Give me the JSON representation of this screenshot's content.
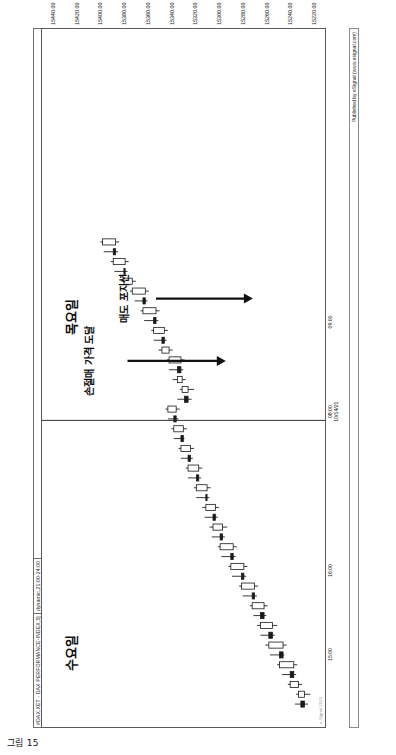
{
  "page": {
    "caption": "그림 15",
    "background": "#ffffff"
  },
  "header": {
    "symbol": "#DAX.XET - DAX PERFORMANCE-INDEX,5]",
    "session": "dynamic,21:00-24:00",
    "divider_color": "#6e6e6e"
  },
  "publisher": {
    "text": "Published by eSignal (www.esignal.com)"
  },
  "day_labels": [
    {
      "label": "수요일",
      "x_frac": 0.08
    },
    {
      "label": "목요일",
      "x_frac": 0.56
    }
  ],
  "annotations": [
    {
      "name": "stop-loss-annotation",
      "text": "손절매 가격 도달",
      "text_x_frac": 0.523,
      "text_y_frac": 0.18,
      "arrow_x_frac": 0.523,
      "arrow_y1_frac": 0.3,
      "arrow_y2_frac": 0.645,
      "arrow_head": true
    },
    {
      "name": "sell-position-annotation",
      "text": "매도 포지션",
      "text_x_frac": 0.612,
      "text_y_frac": 0.3,
      "arrow_x_frac": 0.612,
      "arrow_y1_frac": 0.4,
      "arrow_y2_frac": 0.74,
      "arrow_head": true
    }
  ],
  "chart_data": {
    "type": "candlestick",
    "title": "#DAX.XET - DAX PERFORMANCE-INDEX,5]",
    "subtitle": "dynamic,21:00-24:00",
    "xlabel": "",
    "ylabel": "",
    "grid": false,
    "legend": "none",
    "ylim": [
      15210,
      15450
    ],
    "y_ticks": [
      "15440.00",
      "15420.00",
      "15400.00",
      "15380.00",
      "15360.00",
      "15340.00",
      "15320.00",
      "15300.00",
      "15280.00",
      "15260.00",
      "15240.00",
      "15220.00"
    ],
    "y_tick_values": [
      15440,
      15420,
      15400,
      15380,
      15360,
      15340,
      15320,
      15300,
      15280,
      15260,
      15240,
      15220
    ],
    "x_ticks": [
      {
        "label": "15:00",
        "sub": "",
        "x_frac": 0.105
      },
      {
        "label": "16:00",
        "sub": "",
        "x_frac": 0.225
      },
      {
        "label": "08:00",
        "sub": "10/14/21",
        "x_frac": 0.452
      },
      {
        "label": "09:00",
        "sub": "",
        "x_frac": 0.58
      }
    ],
    "session_break_x_frac": 0.438,
    "up_color": "#ffffff",
    "down_color": "#1a1a1a",
    "wick_color": "#222222",
    "candles": [
      {
        "t": "15:00",
        "o": 15232,
        "h": 15237,
        "l": 15226,
        "c": 15229,
        "dir": "down"
      },
      {
        "t": "15:05",
        "o": 15229,
        "h": 15236,
        "l": 15224,
        "c": 15234,
        "dir": "up"
      },
      {
        "t": "15:10",
        "o": 15234,
        "h": 15243,
        "l": 15231,
        "c": 15241,
        "dir": "up"
      },
      {
        "t": "15:15",
        "o": 15241,
        "h": 15248,
        "l": 15236,
        "c": 15238,
        "dir": "down"
      },
      {
        "t": "15:20",
        "o": 15238,
        "h": 15252,
        "l": 15235,
        "c": 15250,
        "dir": "up"
      },
      {
        "t": "15:25",
        "o": 15250,
        "h": 15258,
        "l": 15246,
        "c": 15247,
        "dir": "down"
      },
      {
        "t": "15:30",
        "o": 15247,
        "h": 15262,
        "l": 15244,
        "c": 15259,
        "dir": "up"
      },
      {
        "t": "15:35",
        "o": 15259,
        "h": 15266,
        "l": 15254,
        "c": 15256,
        "dir": "down"
      },
      {
        "t": "15:40",
        "o": 15256,
        "h": 15269,
        "l": 15252,
        "c": 15266,
        "dir": "up"
      },
      {
        "t": "15:45",
        "o": 15266,
        "h": 15272,
        "l": 15261,
        "c": 15263,
        "dir": "down"
      },
      {
        "t": "15:50",
        "o": 15263,
        "h": 15275,
        "l": 15260,
        "c": 15273,
        "dir": "up"
      },
      {
        "t": "15:55",
        "o": 15273,
        "h": 15281,
        "l": 15269,
        "c": 15271,
        "dir": "down"
      },
      {
        "t": "16:00",
        "o": 15271,
        "h": 15284,
        "l": 15268,
        "c": 15282,
        "dir": "up"
      },
      {
        "t": "16:05",
        "o": 15282,
        "h": 15290,
        "l": 15278,
        "c": 15280,
        "dir": "down"
      },
      {
        "t": "16:10",
        "o": 15280,
        "h": 15293,
        "l": 15277,
        "c": 15291,
        "dir": "up"
      },
      {
        "t": "16:15",
        "o": 15291,
        "h": 15299,
        "l": 15287,
        "c": 15289,
        "dir": "down"
      },
      {
        "t": "16:20",
        "o": 15289,
        "h": 15302,
        "l": 15286,
        "c": 15300,
        "dir": "up"
      },
      {
        "t": "16:25",
        "o": 15300,
        "h": 15307,
        "l": 15296,
        "c": 15298,
        "dir": "down"
      },
      {
        "t": "16:30",
        "o": 15298,
        "h": 15309,
        "l": 15294,
        "c": 15306,
        "dir": "up"
      },
      {
        "t": "16:35",
        "o": 15306,
        "h": 15313,
        "l": 15302,
        "c": 15304,
        "dir": "down"
      },
      {
        "t": "16:40",
        "o": 15304,
        "h": 15315,
        "l": 15301,
        "c": 15312,
        "dir": "up"
      },
      {
        "t": "16:45",
        "o": 15312,
        "h": 15320,
        "l": 15309,
        "c": 15311,
        "dir": "down"
      },
      {
        "t": "16:50",
        "o": 15311,
        "h": 15322,
        "l": 15308,
        "c": 15320,
        "dir": "up"
      },
      {
        "t": "16:55",
        "o": 15320,
        "h": 15327,
        "l": 15316,
        "c": 15318,
        "dir": "down"
      },
      {
        "t": "17:00",
        "o": 15318,
        "h": 15329,
        "l": 15315,
        "c": 15327,
        "dir": "up"
      },
      {
        "t": "17:05",
        "o": 15327,
        "h": 15333,
        "l": 15323,
        "c": 15325,
        "dir": "down"
      },
      {
        "t": "17:10",
        "o": 15325,
        "h": 15335,
        "l": 15322,
        "c": 15333,
        "dir": "up"
      },
      {
        "t": "17:15",
        "o": 15333,
        "h": 15339,
        "l": 15330,
        "c": 15331,
        "dir": "down"
      },
      {
        "t": "17:20",
        "o": 15331,
        "h": 15341,
        "l": 15328,
        "c": 15339,
        "dir": "up"
      },
      {
        "t": "17:25",
        "o": 15339,
        "h": 15344,
        "l": 15335,
        "c": 15337,
        "dir": "down"
      },
      {
        "t": "17:30",
        "o": 15337,
        "h": 15346,
        "l": 15334,
        "c": 15344,
        "dir": "up"
      },
      {
        "t": "08:00",
        "o": 15330,
        "h": 15336,
        "l": 15324,
        "c": 15327,
        "dir": "down"
      },
      {
        "t": "08:05",
        "o": 15327,
        "h": 15334,
        "l": 15322,
        "c": 15332,
        "dir": "up"
      },
      {
        "t": "08:10",
        "o": 15332,
        "h": 15340,
        "l": 15329,
        "c": 15336,
        "dir": "up"
      },
      {
        "t": "08:15",
        "o": 15336,
        "h": 15343,
        "l": 15331,
        "c": 15333,
        "dir": "down"
      },
      {
        "t": "08:20",
        "o": 15333,
        "h": 15345,
        "l": 15330,
        "c": 15343,
        "dir": "up"
      },
      {
        "t": "08:25",
        "o": 15343,
        "h": 15352,
        "l": 15340,
        "c": 15349,
        "dir": "up"
      },
      {
        "t": "08:30",
        "o": 15349,
        "h": 15356,
        "l": 15345,
        "c": 15347,
        "dir": "down"
      },
      {
        "t": "08:35",
        "o": 15347,
        "h": 15358,
        "l": 15344,
        "c": 15356,
        "dir": "up"
      },
      {
        "t": "08:40",
        "o": 15356,
        "h": 15364,
        "l": 15352,
        "c": 15354,
        "dir": "down"
      },
      {
        "t": "08:45",
        "o": 15354,
        "h": 15367,
        "l": 15351,
        "c": 15365,
        "dir": "up"
      },
      {
        "t": "08:50",
        "o": 15365,
        "h": 15372,
        "l": 15361,
        "c": 15363,
        "dir": "down"
      },
      {
        "t": "08:55",
        "o": 15363,
        "h": 15376,
        "l": 15360,
        "c": 15374,
        "dir": "up"
      },
      {
        "t": "09:00",
        "o": 15374,
        "h": 15383,
        "l": 15371,
        "c": 15381,
        "dir": "up"
      },
      {
        "t": "09:05",
        "o": 15381,
        "h": 15389,
        "l": 15378,
        "c": 15380,
        "dir": "down"
      },
      {
        "t": "09:10",
        "o": 15380,
        "h": 15392,
        "l": 15377,
        "c": 15390,
        "dir": "up"
      },
      {
        "t": "09:15",
        "o": 15390,
        "h": 15398,
        "l": 15386,
        "c": 15388,
        "dir": "down"
      },
      {
        "t": "09:20",
        "o": 15388,
        "h": 15401,
        "l": 15385,
        "c": 15399,
        "dir": "up"
      }
    ]
  }
}
